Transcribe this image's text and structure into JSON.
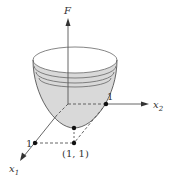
{
  "diagram": {
    "axes": {
      "vertical": {
        "label": "F"
      },
      "x2": {
        "label": "x",
        "subscript": "2",
        "tick_label": "1"
      },
      "x1": {
        "label": "x",
        "subscript": "1",
        "tick_label": "1"
      }
    },
    "minimum_point_label": "(1, 1)",
    "colors": {
      "surface_fill": "#d9d9d9",
      "lines": "#555555",
      "points": "#111111"
    }
  }
}
